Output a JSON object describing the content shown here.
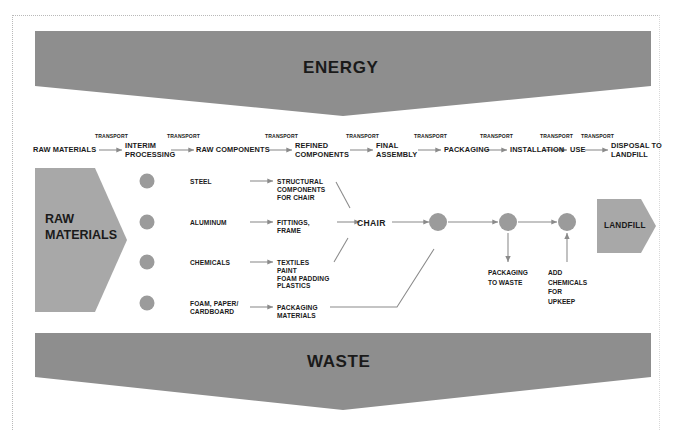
{
  "diagram": {
    "title_energy": "ENERGY",
    "title_waste": "WASTE",
    "colors": {
      "fill_gray": "#8e8e8e",
      "chevron_gray": "#a8a8a8",
      "node_gray": "#9b9b9b",
      "line_gray": "#8a8a8a",
      "text_dark": "#1a1a1a",
      "frame_dotted": "#b9b9b9"
    }
  },
  "stages": [
    {
      "label": "RAW MATERIALS"
    },
    {
      "label": "INTERIM\nPROCESSING"
    },
    {
      "label": "RAW COMPONENTS"
    },
    {
      "label": "REFINED\nCOMPONENTS"
    },
    {
      "label": "FINAL\nASSEMBLY"
    },
    {
      "label": "PACKAGING"
    },
    {
      "label": "INSTALLATION"
    },
    {
      "label": "USE"
    },
    {
      "label": "DISPOSAL TO\nLANDFILL"
    }
  ],
  "transport_labels": [
    {
      "label": "TRANSPORT"
    },
    {
      "label": "TRANSPORT"
    },
    {
      "label": "TRANSPORT"
    },
    {
      "label": "TRANSPORT"
    },
    {
      "label": "TRANSPORT"
    },
    {
      "label": "TRANSPORT"
    },
    {
      "label": "TRANSPORT"
    },
    {
      "label": "TRANSPORT"
    }
  ],
  "chevrons": {
    "raw_materials": "RAW\nMATERIALS",
    "landfill": "LANDFILL"
  },
  "rows": [
    {
      "material": "STEEL",
      "component": "STRUCTURAL\nCOMPONENTS\nFOR CHAIR"
    },
    {
      "material": "ALUMINUM",
      "component": "FITTINGS,\nFRAME"
    },
    {
      "material": "CHEMICALS",
      "component": "TEXTILES\nPAINT\nFOAM PADDING\nPLASTICS"
    },
    {
      "material": "FOAM, PAPER/\nCARDBOARD",
      "component": "PACKAGING\nMATERIALS"
    }
  ],
  "assembly": {
    "product": "CHAIR"
  },
  "notes": [
    {
      "label": "PACKAGING\nTO WASTE"
    },
    {
      "label": "ADD\nCHEMICALS\nFOR\nUPKEEP"
    }
  ]
}
